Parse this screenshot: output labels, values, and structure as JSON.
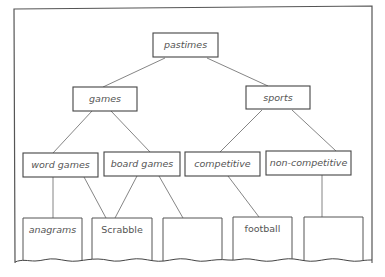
{
  "diagram": {
    "type": "tree",
    "root": {
      "label": "pastimes"
    },
    "level1": [
      {
        "id": "games",
        "label": "games"
      },
      {
        "id": "sports",
        "label": "sports"
      }
    ],
    "level2": [
      {
        "id": "word-games",
        "label": "word games",
        "parent": "games"
      },
      {
        "id": "board-games",
        "label": "board games",
        "parent": "games"
      },
      {
        "id": "competitive",
        "label": "competitive",
        "parent": "sports"
      },
      {
        "id": "non-competitive",
        "label": "non-competitive",
        "parent": "sports"
      }
    ],
    "leaves": [
      {
        "id": "anagrams",
        "label": "anagrams",
        "parents": [
          "word games"
        ]
      },
      {
        "id": "scrabble",
        "label": "Scrabble",
        "parents": [
          "word games",
          "board games"
        ]
      },
      {
        "id": "empty-1",
        "label": "",
        "parents": [
          "board games"
        ]
      },
      {
        "id": "football",
        "label": "football",
        "parents": [
          "competitive"
        ]
      },
      {
        "id": "empty-2",
        "label": "",
        "parents": [
          "non-competitive"
        ]
      }
    ],
    "colors": {
      "line": "#777777",
      "box_border": "#444444",
      "text": "#555555",
      "background": "#ffffff"
    }
  }
}
